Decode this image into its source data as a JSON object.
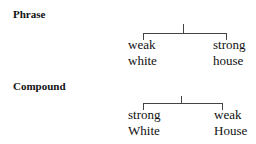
{
  "sections": [
    {
      "heading": "Phrase",
      "left": {
        "line1": "weak",
        "line2": "white"
      },
      "right": {
        "line1": "strong",
        "line2": "house"
      }
    },
    {
      "heading": "Compound",
      "left": {
        "line1": "strong",
        "line2": "White"
      },
      "right": {
        "line1": "weak",
        "line2": "House"
      }
    }
  ],
  "colors": {
    "text": "#111111",
    "lines": "#444444",
    "background": "#ffffff"
  }
}
